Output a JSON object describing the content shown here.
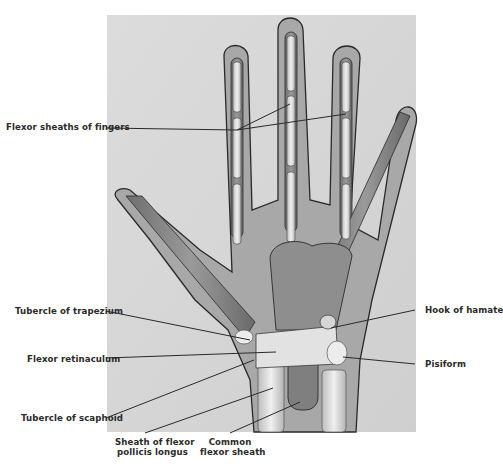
{
  "figure": {
    "background_color": "#d8d8d8",
    "hand_fill": "#a9a9a9",
    "sheath_fill": "#8c8c8c",
    "bone_fill": "#e6e6e6",
    "outline_color": "#2a2a2a"
  },
  "labels": [
    {
      "id": "flexor-sheaths-fingers",
      "text": "Flexor sheaths of fingers"
    },
    {
      "id": "tubercle-trapezium",
      "text": "Tubercle of trapezium"
    },
    {
      "id": "flexor-retinaculum",
      "text": "Flexor retinaculum"
    },
    {
      "id": "tubercle-scaphoid",
      "text": "Tubercle of scaphoid"
    },
    {
      "id": "sheath-fpl",
      "line1": "Sheath of flexor",
      "line2": "pollicis longus"
    },
    {
      "id": "common-flexor-sheath",
      "line1": "Common",
      "line2": "flexor sheath"
    },
    {
      "id": "hook-hamate",
      "text": "Hook of hamate"
    },
    {
      "id": "pisiform",
      "text": "Pisiform"
    }
  ]
}
